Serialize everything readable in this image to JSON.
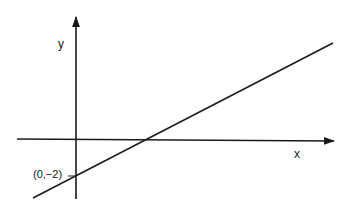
{
  "diagram": {
    "type": "cartesian-line-graph",
    "axes": {
      "x_label": "x",
      "y_label": "y"
    },
    "line": {
      "description": "straight line with positive slope",
      "y_intercept_label": "(0,−2)"
    },
    "colors": {
      "ink": "#1a1a1a",
      "background": "#ffffff"
    }
  }
}
